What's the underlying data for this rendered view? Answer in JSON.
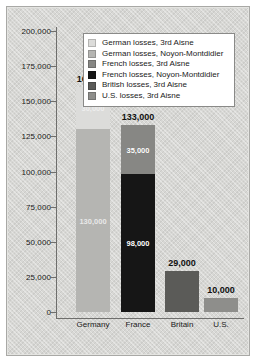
{
  "chart_data": {
    "type": "bar",
    "subtype": "stacked-bar",
    "title": "",
    "xlabel": "",
    "ylabel": "",
    "ylim": [
      0,
      200000
    ],
    "ytick_values": [
      0,
      25000,
      50000,
      75000,
      100000,
      125000,
      150000,
      175000,
      200000
    ],
    "ytick_labels": [
      "0",
      "25,000",
      "50,000",
      "75,000",
      "100,000",
      "125,000",
      "150,000",
      "175,000",
      "200,000"
    ],
    "grid": false,
    "legend_position": "top-center-inside",
    "categories": [
      "Germany",
      "France",
      "Britain",
      "U.S."
    ],
    "totals": [
      160000,
      133000,
      29000,
      10000
    ],
    "total_labels": [
      "160,000",
      "133,000",
      "29,000",
      "10,000"
    ],
    "series": [
      {
        "name": "German losses, 3rd Aisne",
        "color": "#dcdcda",
        "values": [
          30000,
          0,
          0,
          0
        ],
        "value_labels": [
          "30,000",
          "",
          "",
          ""
        ]
      },
      {
        "name": "German losses, Noyon-Montdidier",
        "color": "#b5b5b2",
        "values": [
          130000,
          0,
          0,
          0
        ],
        "value_labels": [
          "130,000",
          "",
          "",
          ""
        ]
      },
      {
        "name": "French losses, 3rd Aisne",
        "color": "#878784",
        "values": [
          0,
          35000,
          0,
          0
        ],
        "value_labels": [
          "",
          "35,000",
          "",
          ""
        ]
      },
      {
        "name": "French losses, Noyon-Montdidier",
        "color": "#161616",
        "values": [
          0,
          98000,
          0,
          0
        ],
        "value_labels": [
          "",
          "98,000",
          "",
          ""
        ]
      },
      {
        "name": "British losses, 3rd Aisne",
        "color": "#5b5b58",
        "values": [
          0,
          0,
          29000,
          0
        ],
        "value_labels": [
          "",
          "",
          "",
          ""
        ]
      },
      {
        "name": "U.S. losses, 3rd Aisne",
        "color": "#8e8e8b",
        "values": [
          0,
          0,
          0,
          10000
        ],
        "value_labels": [
          "",
          "",
          "",
          ""
        ]
      }
    ]
  },
  "axis": {
    "ticks": [
      {
        "label": "200,000"
      },
      {
        "label": "175,000"
      },
      {
        "label": "150,000"
      },
      {
        "label": "125,000"
      },
      {
        "label": "100,000"
      },
      {
        "label": "75,000"
      },
      {
        "label": "50,000"
      },
      {
        "label": "25,000"
      },
      {
        "label": "0"
      }
    ]
  },
  "legend": {
    "items": [
      {
        "swatch": "#dcdcda",
        "label": "German losses, 3rd Aisne"
      },
      {
        "swatch": "#b5b5b2",
        "label": "German losses, Noyon-Montdidier"
      },
      {
        "swatch": "#878784",
        "label": "French losses, 3rd Aisne"
      },
      {
        "swatch": "#161616",
        "label": "French losses, Noyon-Montdidier"
      },
      {
        "swatch": "#5b5b58",
        "label": "British losses, 3rd Aisne"
      },
      {
        "swatch": "#8e8e8b",
        "label": "U.S. losses, 3rd Aisne"
      }
    ]
  },
  "bars": [
    {
      "category": "Germany",
      "total_label": "160,000",
      "segments": [
        {
          "label": "30,000",
          "color": "#dcdcda",
          "value": 30000,
          "faint": true
        },
        {
          "label": "130,000",
          "color": "#b5b5b2",
          "value": 130000,
          "faint": true
        }
      ]
    },
    {
      "category": "France",
      "total_label": "133,000",
      "segments": [
        {
          "label": "35,000",
          "color": "#878784",
          "value": 35000,
          "faint": false
        },
        {
          "label": "98,000",
          "color": "#161616",
          "value": 98000,
          "faint": false
        }
      ]
    },
    {
      "category": "Britain",
      "total_label": "29,000",
      "segments": [
        {
          "label": "",
          "color": "#5b5b58",
          "value": 29000,
          "faint": false
        }
      ]
    },
    {
      "category": "U.S.",
      "total_label": "10,000",
      "segments": [
        {
          "label": "",
          "color": "#8e8e8b",
          "value": 10000,
          "faint": false
        }
      ]
    }
  ],
  "colors": {
    "plate_background": "#d7d7d4",
    "axis_line": "#6e6e6c",
    "text": "#1a1a1a",
    "legend_background": "#ffffff"
  }
}
